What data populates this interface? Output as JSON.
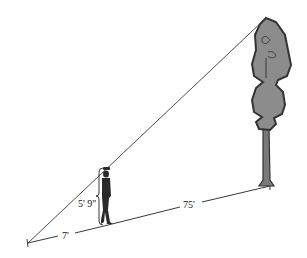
{
  "diagram": {
    "labels": {
      "person_height": "5' 9\"",
      "shadow_to_person": "7'",
      "person_to_tree": "75'"
    },
    "elements": {
      "person": "man standing",
      "tree": "tall tree",
      "sight_line": "line from shadow tip through top of person to top of tree"
    },
    "colors": {
      "line": "#222222",
      "tree_fill": "#8c8c8c",
      "tree_outline": "#333333",
      "person": "#2a2a2a"
    }
  }
}
